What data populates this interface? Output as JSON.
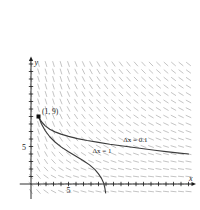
{
  "figure": {
    "kind": "slope-field-with-euler-curves",
    "background_color": "#ffffff"
  },
  "axes": {
    "x_axis_name": "x",
    "y_axis_name": "y",
    "x_tick_label": "5",
    "y_tick_label": "5",
    "x_tick_label_value": 5,
    "y_tick_label_value": 5,
    "axis_color": "#1a1a1a",
    "origin_px": {
      "x": 31,
      "y": 184
    },
    "unit_px": 7.5,
    "x_range": [
      -1.5,
      22
    ],
    "y_range": [
      -2,
      17
    ],
    "x_ticks": [
      1,
      2,
      3,
      4,
      5,
      6,
      7,
      8,
      9,
      10,
      11,
      12,
      13,
      14,
      15,
      16,
      17,
      18,
      19,
      20,
      21
    ],
    "y_ticks": [
      1,
      2,
      3,
      4,
      5,
      6,
      7,
      8,
      9,
      10,
      11,
      12,
      13,
      14,
      15,
      16
    ]
  },
  "slope_field": {
    "dash_color": "#b9b9b9",
    "dash_length_px": 6,
    "description": "short gray line segments of negative slope, steepest near the y-axis and the lower-left, flattening toward the upper right",
    "x_samples": [
      0,
      1,
      2,
      3,
      4,
      5,
      6,
      7,
      8,
      9,
      10,
      11,
      12,
      13,
      14,
      15,
      16,
      17,
      18,
      19,
      20,
      21
    ],
    "y_samples": [
      -1,
      0,
      1,
      2,
      3,
      4,
      5,
      6,
      7,
      8,
      9,
      10,
      11,
      12,
      13,
      14,
      15,
      16
    ]
  },
  "initial_point": {
    "label": "(1, 9)",
    "x": 1,
    "y": 9,
    "marker_color": "#111111"
  },
  "curves": [
    {
      "id": "dx-0-1",
      "label": "Δx = 0.1",
      "step": 0.1,
      "label_position": {
        "x": 12.3,
        "y": 5.6
      },
      "color": "#3c3c3c",
      "points": [
        {
          "x": 1,
          "y": 9
        },
        {
          "x": 1.4,
          "y": 8.3
        },
        {
          "x": 1.9,
          "y": 7.75
        },
        {
          "x": 2.5,
          "y": 7.3
        },
        {
          "x": 3.2,
          "y": 6.95
        },
        {
          "x": 4.0,
          "y": 6.65
        },
        {
          "x": 5.0,
          "y": 6.35
        },
        {
          "x": 6.2,
          "y": 6.05
        },
        {
          "x": 7.5,
          "y": 5.8
        },
        {
          "x": 9.0,
          "y": 5.55
        },
        {
          "x": 10.5,
          "y": 5.3
        },
        {
          "x": 12.0,
          "y": 5.1
        },
        {
          "x": 13.5,
          "y": 4.9
        },
        {
          "x": 15.0,
          "y": 4.7
        },
        {
          "x": 16.5,
          "y": 4.5
        },
        {
          "x": 18.0,
          "y": 4.32
        },
        {
          "x": 19.5,
          "y": 4.15
        },
        {
          "x": 21.0,
          "y": 4.0
        }
      ]
    },
    {
      "id": "dx-1",
      "label": "Δx = 1",
      "step": 1,
      "label_position": {
        "x": 8.2,
        "y": 4.2
      },
      "color": "#3c3c3c",
      "points": [
        {
          "x": 1,
          "y": 9
        },
        {
          "x": 1.4,
          "y": 8.0
        },
        {
          "x": 1.9,
          "y": 7.1
        },
        {
          "x": 2.5,
          "y": 6.3
        },
        {
          "x": 3.2,
          "y": 5.6
        },
        {
          "x": 4.0,
          "y": 4.95
        },
        {
          "x": 5.0,
          "y": 4.3
        },
        {
          "x": 6.0,
          "y": 3.7
        },
        {
          "x": 7.0,
          "y": 3.1
        },
        {
          "x": 7.8,
          "y": 2.55
        },
        {
          "x": 8.5,
          "y": 1.95
        },
        {
          "x": 9.0,
          "y": 1.35
        },
        {
          "x": 9.4,
          "y": 0.75
        },
        {
          "x": 9.7,
          "y": 0.1
        },
        {
          "x": 9.85,
          "y": -0.55
        },
        {
          "x": 9.95,
          "y": -1.2
        }
      ]
    }
  ]
}
